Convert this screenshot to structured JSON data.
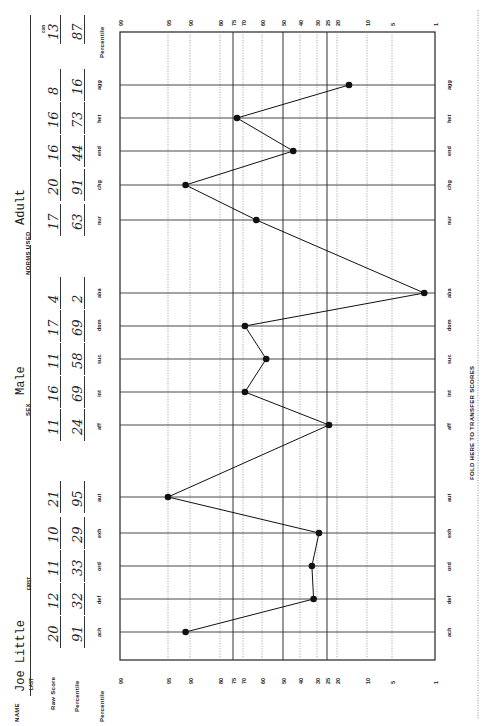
{
  "form": {
    "name_label": "NAME",
    "last_label": "LAST",
    "first_label": "FIRST",
    "name_value": "Joe Little",
    "sex_label": "SEX",
    "sex_value": "Male",
    "norms_label": "NORMS USED",
    "norms_value": "Adult",
    "raw_score_label": "Raw Score",
    "percentile_label": "Percentile",
    "con_label": "con",
    "fold_text": "FOLD HERE TO TRANSFER SCORES"
  },
  "scores": [
    {
      "scale": "ach",
      "raw": "20",
      "pct": "91"
    },
    {
      "scale": "def",
      "raw": "12",
      "pct": "32"
    },
    {
      "scale": "ord",
      "raw": "11",
      "pct": "33"
    },
    {
      "scale": "exh",
      "raw": "10",
      "pct": "29"
    },
    {
      "scale": "aut",
      "raw": "21",
      "pct": "95"
    },
    {
      "scale": "aff",
      "raw": "11",
      "pct": "24"
    },
    {
      "scale": "int",
      "raw": "16",
      "pct": "69"
    },
    {
      "scale": "suc",
      "raw": "11",
      "pct": "58"
    },
    {
      "scale": "dom",
      "raw": "17",
      "pct": "69"
    },
    {
      "scale": "aba",
      "raw": "4",
      "pct": "2"
    },
    {
      "scale": "nur",
      "raw": "17",
      "pct": "63"
    },
    {
      "scale": "chg",
      "raw": "20",
      "pct": "91"
    },
    {
      "scale": "end",
      "raw": "16",
      "pct": "44"
    },
    {
      "scale": "het",
      "raw": "16",
      "pct": "73"
    },
    {
      "scale": "agg",
      "raw": "8",
      "pct": "16"
    }
  ],
  "con": {
    "raw": "13",
    "pct": "87"
  },
  "axis": {
    "title": "Percentile",
    "ticks": [
      "99",
      "95",
      "90",
      "80",
      "75",
      "70",
      "60",
      "50",
      "40",
      "30",
      "25",
      "20",
      "10",
      "5",
      "1"
    ]
  },
  "chart_data": {
    "type": "line",
    "xlabel": "Scale",
    "ylabel": "Percentile",
    "categories": [
      "ach",
      "def",
      "ord",
      "exh",
      "aut",
      "aff",
      "int",
      "suc",
      "dom",
      "aba",
      "nur",
      "chg",
      "end",
      "het",
      "agg"
    ],
    "series": [
      {
        "name": "Percentile",
        "values": [
          91,
          32,
          33,
          29,
          95,
          24,
          69,
          58,
          69,
          2,
          63,
          91,
          44,
          73,
          16
        ]
      },
      {
        "name": "Raw Score",
        "values": [
          20,
          12,
          11,
          10,
          21,
          11,
          16,
          11,
          17,
          4,
          17,
          20,
          16,
          16,
          8
        ]
      }
    ],
    "ylim": [
      1,
      99
    ],
    "y_ticks": [
      99,
      95,
      90,
      80,
      75,
      70,
      60,
      50,
      40,
      30,
      25,
      20,
      10,
      5,
      1
    ],
    "solid_gridlines": [
      75,
      50,
      25
    ],
    "orientation": "rotated 90 degrees counterclockwise",
    "grid": true,
    "group_gaps_after": [
      "aut",
      "aba"
    ]
  }
}
